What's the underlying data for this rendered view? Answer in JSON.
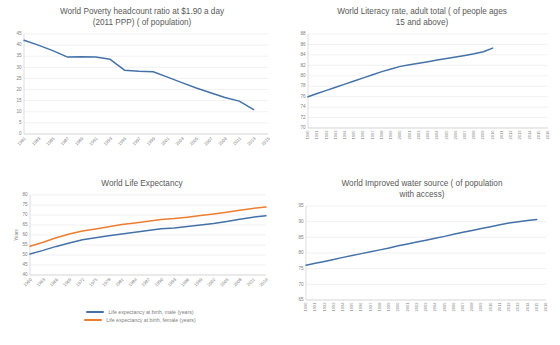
{
  "palette": {
    "blue": "#4472a8",
    "orange": "#ed7d31",
    "grid": "#e8e8e8",
    "text": "#595959",
    "tick": "#808080",
    "background": "#ffffff"
  },
  "charts": [
    {
      "id": "poverty",
      "title_line1": "World Poverty headcount ratio at $1.90 a day",
      "title_line2": "(2011 PPP) ( of population)",
      "chart_data": {
        "type": "line",
        "title": "World Poverty headcount ratio at $1.90 a day (2011 PPP) ( of population)",
        "xlabel": "",
        "ylabel": "",
        "ylim": [
          0,
          45
        ],
        "yticks": [
          45,
          40,
          35,
          30,
          25,
          20,
          15,
          10,
          5,
          0
        ],
        "grid": true,
        "legend": "none",
        "categories": [
          "1981",
          "1983",
          "1985",
          "1987",
          "1989",
          "1991",
          "1993",
          "1995",
          "1997",
          "1999",
          "2001",
          "2003",
          "2005",
          "2007",
          "2009",
          "2011",
          "2013",
          "2015"
        ],
        "series": [
          {
            "name": "Poverty headcount ratio at $1.90 a day (2011 PPP) (% of population)",
            "color": "#4472a8",
            "values": [
              42.2,
              40.0,
              37.5,
              34.7,
              34.8,
              34.7,
              33.6,
              28.7,
              28.2,
              28.0,
              25.6,
              23.1,
              20.7,
              18.6,
              16.4,
              14.8,
              11.0,
              null
            ]
          }
        ]
      }
    },
    {
      "id": "literacy",
      "title_line1": "World Literacy rate, adult total ( of people ages",
      "title_line2": "15 and above)",
      "chart_data": {
        "type": "line",
        "title": "World Literacy rate, adult total ( of people ages 15 and above)",
        "xlabel": "",
        "ylabel": "",
        "ylim": [
          70,
          88
        ],
        "yticks": [
          88,
          86,
          84,
          82,
          80,
          78,
          76,
          74,
          72,
          70
        ],
        "grid": true,
        "legend": "none",
        "categories": [
          "1990",
          "1991",
          "1992",
          "1993",
          "1994",
          "1995",
          "1996",
          "1997",
          "1998",
          "1999",
          "2000",
          "2001",
          "2002",
          "2003",
          "2004",
          "2005",
          "2006",
          "2007",
          "2008",
          "2009",
          "2010",
          "2011",
          "2012",
          "2013",
          "2014",
          "2015",
          "2016"
        ],
        "series": [
          {
            "name": "Literacy rate, adult total (% of people ages 15 and above)",
            "color": "#4472a8",
            "values": [
              76.0,
              76.6,
              77.2,
              77.8,
              78.4,
              79.0,
              79.6,
              80.2,
              80.8,
              81.3,
              81.8,
              82.1,
              82.4,
              82.7,
              83.0,
              83.3,
              83.6,
              83.9,
              84.2,
              84.6,
              85.3,
              null,
              null,
              null,
              null,
              null,
              null
            ]
          }
        ]
      }
    },
    {
      "id": "life-expectancy",
      "title_line1": "World Life Expectancy",
      "title_line2": "",
      "chart_data": {
        "type": "line",
        "title": "World Life Expectancy",
        "xlabel": "",
        "ylabel": "Years",
        "ylim": [
          40,
          80
        ],
        "yticks": [
          80,
          75,
          70,
          65,
          60,
          55,
          50,
          45,
          40
        ],
        "grid": true,
        "legend": "bottom",
        "categories": [
          "1960",
          "1963",
          "1966",
          "1969",
          "1972",
          "1975",
          "1978",
          "1981",
          "1984",
          "1987",
          "1990",
          "1993",
          "1996",
          "1999",
          "2002",
          "2005",
          "2008",
          "2011",
          "2014"
        ],
        "series": [
          {
            "name": "Life expectancy at birth, male (years)",
            "color": "#4472a8",
            "values": [
              50.5,
              52.3,
              54.3,
              56.0,
              57.6,
              58.6,
              59.6,
              60.5,
              61.4,
              62.3,
              63.1,
              63.5,
              64.2,
              65.0,
              65.8,
              66.8,
              67.9,
              68.9,
              69.6
            ]
          },
          {
            "name": "Life expectancy at birth, female (years)",
            "color": "#ed7d31",
            "values": [
              54.4,
              56.4,
              58.6,
              60.5,
              62.0,
              63.0,
              64.1,
              65.2,
              66.0,
              66.9,
              67.7,
              68.2,
              68.9,
              69.7,
              70.5,
              71.4,
              72.4,
              73.3,
              74.0
            ]
          }
        ]
      }
    },
    {
      "id": "water-source",
      "title_line1": "World Improved water source ( of population",
      "title_line2": "with access)",
      "chart_data": {
        "type": "line",
        "title": "World Improved water source ( of population with access)",
        "xlabel": "",
        "ylabel": "",
        "ylim": [
          65,
          95
        ],
        "yticks": [
          95,
          90,
          85,
          80,
          75,
          70,
          65
        ],
        "grid": true,
        "legend": "none",
        "categories": [
          "1990",
          "1991",
          "1992",
          "1993",
          "1994",
          "1995",
          "1996",
          "1997",
          "1998",
          "1999",
          "2000",
          "2001",
          "2002",
          "2003",
          "2004",
          "2005",
          "2006",
          "2007",
          "2008",
          "2009",
          "2010",
          "2011",
          "2012",
          "2013",
          "2014",
          "2015",
          "2016"
        ],
        "series": [
          {
            "name": "Improved water source (% of population with access)",
            "color": "#4472a8",
            "values": [
              76.1,
              76.7,
              77.3,
              77.9,
              78.6,
              79.2,
              79.8,
              80.4,
              81.0,
              81.6,
              82.3,
              82.9,
              83.5,
              84.1,
              84.7,
              85.3,
              86.0,
              86.6,
              87.2,
              87.8,
              88.4,
              89.0,
              89.6,
              90.0,
              90.4,
              90.7,
              null
            ]
          }
        ]
      }
    }
  ]
}
